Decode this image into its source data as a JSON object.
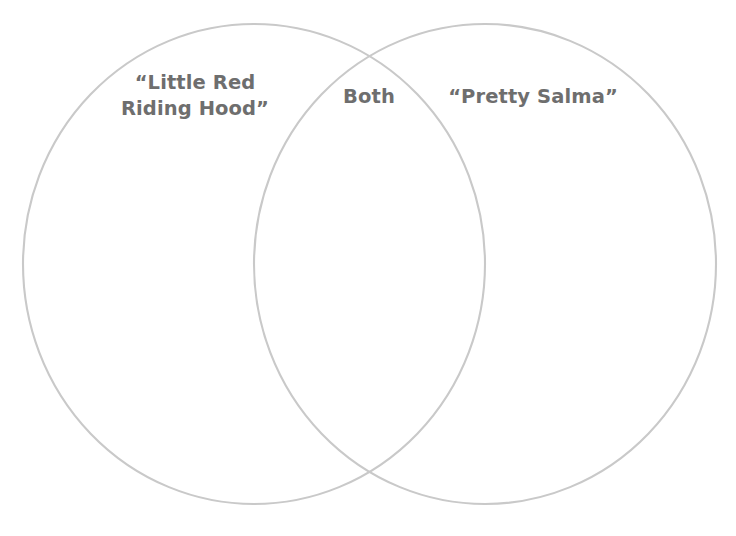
{
  "page": {
    "background_color": "#ffffff",
    "width": 736,
    "height": 536
  },
  "diagram": {
    "type": "venn-two-circle",
    "stroke_color": "#c9c9c9",
    "stroke_width": 2.1,
    "fill": "none",
    "text_color": "#6e6e6e",
    "left_ellipse": {
      "cx": 254,
      "cy": 264,
      "rx": 231,
      "ry": 240
    },
    "right_ellipse": {
      "cx": 485,
      "cy": 264,
      "rx": 231,
      "ry": 240
    }
  },
  "labels": {
    "left": "“Little Red\nRiding Hood”",
    "both": "Both",
    "right": "“Pretty Salma”"
  }
}
